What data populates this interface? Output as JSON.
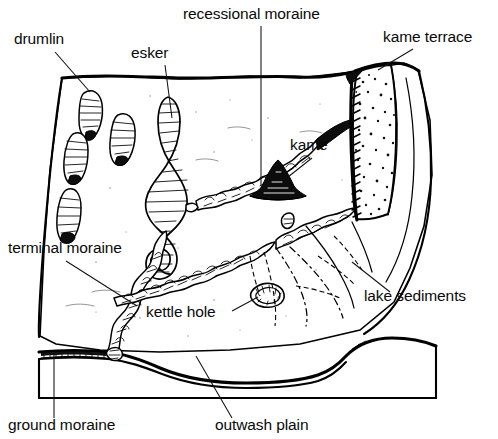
{
  "figure": {
    "type": "block-diagram",
    "style": "pen-and-ink line drawing, black on white",
    "background_color": "#ffffff",
    "ink_color": "#000000"
  },
  "labels": [
    {
      "id": "drumlin",
      "text": "drumlin",
      "x": 14,
      "y": 44,
      "anchor": "start",
      "leader": true
    },
    {
      "id": "esker",
      "text": "esker",
      "x": 131,
      "y": 58,
      "anchor": "start",
      "leader": true
    },
    {
      "id": "recessional-moraine",
      "text": "recessional moraine",
      "x": 183,
      "y": 19,
      "anchor": "start",
      "leader": true
    },
    {
      "id": "kame-terrace",
      "text": "kame terrace",
      "x": 383,
      "y": 42,
      "anchor": "start",
      "leader": true
    },
    {
      "id": "kame",
      "text": "kame",
      "x": 290,
      "y": 150,
      "anchor": "start",
      "leader": true
    },
    {
      "id": "terminal-moraine",
      "text": "terminal moraine",
      "x": 8,
      "y": 253,
      "anchor": "start",
      "leader": true
    },
    {
      "id": "kettle-hole",
      "text": "kettle hole",
      "x": 146,
      "y": 317,
      "anchor": "start",
      "leader": true
    },
    {
      "id": "lake-sediments",
      "text": "lake sediments",
      "x": 364,
      "y": 301,
      "anchor": "start",
      "leader": true
    },
    {
      "id": "ground-moraine",
      "text": "ground moraine",
      "x": 8,
      "y": 430,
      "anchor": "start",
      "leader": true
    },
    {
      "id": "outwash-plain",
      "text": "outwash plain",
      "x": 215,
      "y": 430,
      "anchor": "start",
      "leader": true
    }
  ],
  "features": {
    "drumlin_count": 4,
    "esker_description": "long sinuous winding ridge",
    "kame_description": "isolated dark conical mound",
    "kettle_hole_description": "small circular depression",
    "moraine_description": "knobby hummocky ridge belts",
    "kame_terrace_description": "stippled bench along valley wall",
    "lake_sediments_description": "dashed fan-shaped contours"
  }
}
